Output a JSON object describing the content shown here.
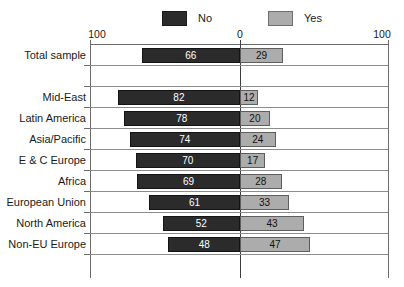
{
  "legend": {
    "entries": [
      {
        "label": "No",
        "color": "#2b2b2b",
        "swatch": "dark-swatch"
      },
      {
        "label": "Yes",
        "color": "#abacab",
        "swatch": "light-swatch"
      }
    ]
  },
  "axis": {
    "left_label": "100",
    "zero_label": "0",
    "right_label": "100"
  },
  "chart_data": {
    "type": "bar",
    "orientation": "horizontal",
    "subtype": "diverging-paired",
    "title": "",
    "xlabel": "",
    "ylabel": "",
    "xlim": [
      -100,
      100
    ],
    "axis_tick_labels": [
      "100",
      "0",
      "100"
    ],
    "grid": true,
    "legend_position": "top",
    "categories": [
      "Total sample",
      "",
      "Mid-East",
      "Latin America",
      "Asia/Pacific",
      "E & C Europe",
      "Africa",
      "European Union",
      "North America",
      "Non-EU Europe"
    ],
    "series": [
      {
        "name": "No",
        "color": "#2b2b2b",
        "direction": "left",
        "values": [
          66,
          null,
          82,
          78,
          74,
          70,
          69,
          61,
          52,
          48
        ]
      },
      {
        "name": "Yes",
        "color": "#abacab",
        "direction": "right",
        "values": [
          29,
          null,
          12,
          20,
          24,
          17,
          28,
          33,
          43,
          47
        ]
      }
    ],
    "rows": [
      {
        "label": "Total sample",
        "no": 66,
        "yes": 29,
        "spacer": false
      },
      {
        "label": "",
        "no": null,
        "yes": null,
        "spacer": true
      },
      {
        "label": "Mid-East",
        "no": 82,
        "yes": 12,
        "spacer": false
      },
      {
        "label": "Latin America",
        "no": 78,
        "yes": 20,
        "spacer": false
      },
      {
        "label": "Asia/Pacific",
        "no": 74,
        "yes": 24,
        "spacer": false
      },
      {
        "label": "E & C Europe",
        "no": 70,
        "yes": 17,
        "spacer": false
      },
      {
        "label": "Africa",
        "no": 69,
        "yes": 28,
        "spacer": false
      },
      {
        "label": "European Union",
        "no": 61,
        "yes": 33,
        "spacer": false
      },
      {
        "label": "North America",
        "no": 52,
        "yes": 43,
        "spacer": false
      },
      {
        "label": "Non-EU Europe",
        "no": 48,
        "yes": 47,
        "spacer": false
      }
    ]
  }
}
